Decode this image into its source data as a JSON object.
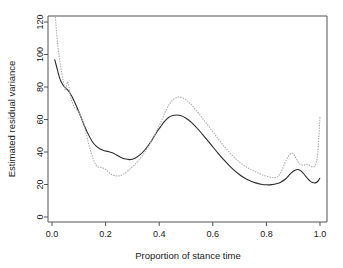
{
  "chart_data": {
    "type": "line",
    "title": "",
    "xlabel": "Proportion of stance time",
    "ylabel": "Estimated residual variance",
    "xlim": [
      0.0,
      1.04
    ],
    "ylim": [
      0,
      125
    ],
    "grid": false,
    "legend": "none",
    "xticks": [
      "0.0",
      "0.2",
      "0.4",
      "0.6",
      "0.8",
      "1.0"
    ],
    "xtick_values": [
      0.0,
      0.2,
      0.4,
      0.6,
      0.8,
      1.0
    ],
    "yticks": [
      "0",
      "20",
      "40",
      "60",
      "80",
      "100",
      "120"
    ],
    "ytick_values": [
      0,
      20,
      40,
      60,
      80,
      100,
      120
    ],
    "series": [
      {
        "name": "solid-curve",
        "style": "solid",
        "color": "#2b2b2b",
        "x": [
          0.01,
          0.018,
          0.025,
          0.032,
          0.04,
          0.048,
          0.056,
          0.065,
          0.075,
          0.085,
          0.095,
          0.105,
          0.12,
          0.135,
          0.15,
          0.165,
          0.18,
          0.195,
          0.21,
          0.225,
          0.24,
          0.255,
          0.27,
          0.29,
          0.31,
          0.33,
          0.35,
          0.37,
          0.39,
          0.405,
          0.42,
          0.435,
          0.45,
          0.465,
          0.48,
          0.5,
          0.52,
          0.545,
          0.57,
          0.595,
          0.62,
          0.645,
          0.67,
          0.695,
          0.72,
          0.74,
          0.76,
          0.78,
          0.8,
          0.82,
          0.84,
          0.855,
          0.87,
          0.882,
          0.893,
          0.905,
          0.918,
          0.93,
          0.942,
          0.952,
          0.962,
          0.972,
          0.982,
          0.992,
          1.0
        ],
        "y": [
          97.0,
          92.0,
          87.5,
          84.0,
          81.5,
          79.8,
          78.6,
          76.8,
          74.0,
          70.5,
          66.8,
          62.8,
          56.5,
          51.0,
          46.5,
          43.6,
          41.8,
          40.8,
          40.3,
          39.5,
          38.2,
          36.8,
          35.8,
          35.3,
          36.2,
          38.5,
          42.0,
          46.6,
          52.0,
          55.5,
          58.8,
          61.2,
          62.4,
          62.8,
          62.4,
          60.8,
          58.2,
          54.0,
          49.2,
          44.2,
          39.2,
          34.5,
          30.2,
          26.6,
          23.8,
          22.2,
          21.0,
          20.2,
          19.8,
          19.9,
          20.6,
          21.6,
          23.2,
          25.2,
          27.2,
          28.6,
          29.2,
          28.2,
          26.0,
          24.0,
          22.2,
          21.2,
          21.0,
          22.0,
          24.0
        ]
      },
      {
        "name": "dotted-curve",
        "style": "dotted",
        "color": "#a9a9a9",
        "x": [
          0.01,
          0.014,
          0.018,
          0.022,
          0.026,
          0.03,
          0.034,
          0.038,
          0.042,
          0.046,
          0.05,
          0.054,
          0.058,
          0.063,
          0.068,
          0.075,
          0.082,
          0.09,
          0.1,
          0.11,
          0.12,
          0.13,
          0.14,
          0.15,
          0.158,
          0.165,
          0.172,
          0.18,
          0.19,
          0.2,
          0.21,
          0.22,
          0.235,
          0.25,
          0.265,
          0.285,
          0.305,
          0.325,
          0.345,
          0.365,
          0.385,
          0.405,
          0.425,
          0.44,
          0.455,
          0.47,
          0.485,
          0.505,
          0.525,
          0.55,
          0.575,
          0.6,
          0.625,
          0.65,
          0.675,
          0.7,
          0.725,
          0.75,
          0.775,
          0.795,
          0.815,
          0.83,
          0.842,
          0.852,
          0.862,
          0.875,
          0.888,
          0.898,
          0.908,
          0.918,
          0.928,
          0.938,
          0.948,
          0.958,
          0.968,
          0.978,
          0.986,
          0.993,
          1.0
        ],
        "y": [
          128.0,
          120.0,
          112.0,
          105.0,
          99.5,
          95.0,
          91.0,
          87.0,
          83.5,
          80.5,
          78.0,
          80.8,
          83.2,
          80.0,
          75.0,
          71.0,
          68.0,
          66.5,
          64.5,
          61.0,
          56.0,
          49.5,
          43.0,
          37.5,
          34.0,
          31.8,
          30.8,
          30.6,
          30.2,
          29.2,
          27.8,
          26.3,
          25.4,
          25.3,
          26.2,
          28.6,
          31.6,
          35.2,
          39.6,
          44.8,
          51.0,
          58.0,
          65.5,
          70.0,
          72.6,
          73.8,
          73.5,
          71.5,
          68.2,
          63.2,
          58.0,
          52.5,
          47.0,
          42.0,
          37.5,
          33.8,
          30.8,
          28.5,
          26.6,
          25.4,
          24.5,
          24.2,
          24.8,
          26.8,
          30.4,
          35.4,
          38.6,
          39.2,
          37.0,
          34.0,
          32.2,
          31.8,
          32.5,
          32.0,
          31.0,
          31.0,
          33.5,
          42.0,
          62.0
        ]
      }
    ]
  }
}
